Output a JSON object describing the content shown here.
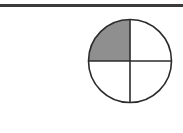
{
  "figure": {
    "total_parts": 4,
    "shaded_parts": 1,
    "shaded_fraction": "1/4",
    "shaded_quadrant": "top-left",
    "colors": {
      "shade": "#8f8f8f",
      "stroke": "#2b2b2b",
      "rule": "#3a3a3a",
      "background": "#ffffff"
    }
  }
}
